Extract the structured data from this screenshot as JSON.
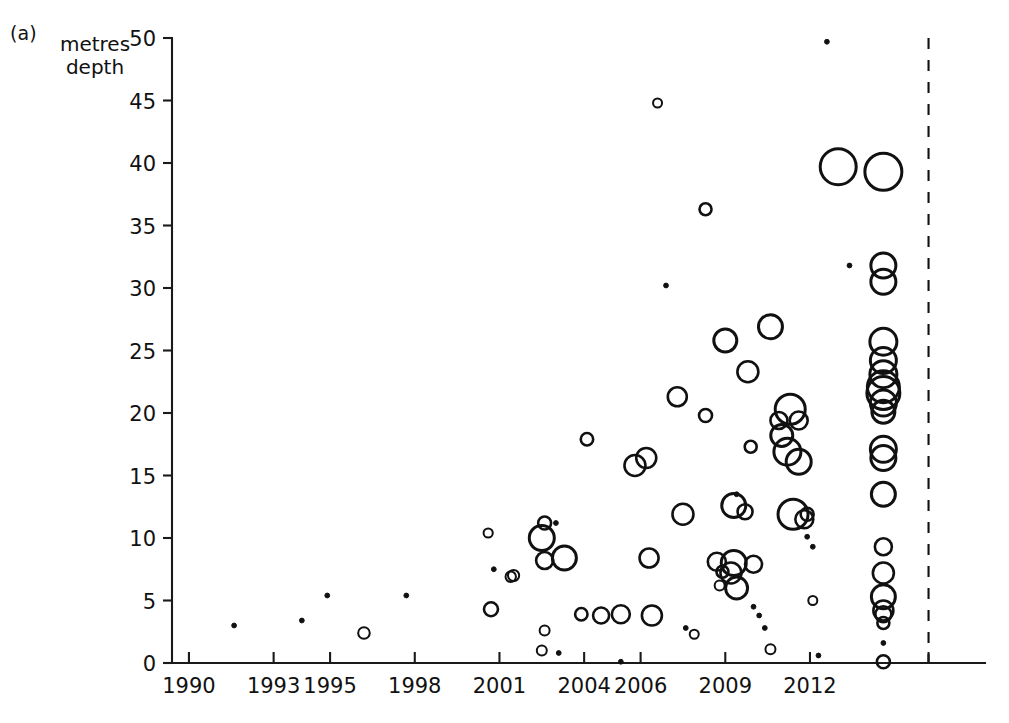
{
  "figure": {
    "panel_label": "(a)",
    "y_axis_title": "metres\ndepth"
  },
  "chart_data": {
    "type": "scatter",
    "title": "",
    "xlabel": "",
    "ylabel": "metres depth",
    "xtick_labels": [
      "1990",
      "1993",
      "1995",
      "1998",
      "2001",
      "2004",
      "2006",
      "2009",
      "2012"
    ],
    "xtick_values": [
      1990,
      1993,
      1995,
      1998,
      2001,
      2004,
      2006,
      2009,
      2012
    ],
    "ytick_labels": [
      "0",
      "5",
      "10",
      "15",
      "20",
      "25",
      "30",
      "35",
      "40",
      "45",
      "50"
    ],
    "ytick_values": [
      0,
      5,
      10,
      15,
      20,
      25,
      30,
      35,
      40,
      45,
      50
    ],
    "xlim": [
      1989.4,
      2018.2
    ],
    "ylim": [
      0,
      50
    ],
    "grid": false,
    "legend": null,
    "marker_style": "open-circle, area proportional to magnitude",
    "annotations": [
      {
        "name": "reference-divider",
        "type": "vertical-dashed-line",
        "x": 2016.2
      }
    ],
    "series": [
      {
        "name": "records",
        "color": "#111111",
        "points": [
          {
            "x": 1991.6,
            "y": 3.0,
            "r": 4.0
          },
          {
            "x": 1994.0,
            "y": 3.4,
            "r": 3.6
          },
          {
            "x": 1994.9,
            "y": 5.4,
            "r": 4.2
          },
          {
            "x": 1996.2,
            "y": 2.4,
            "r": 5.8
          },
          {
            "x": 1997.7,
            "y": 5.4,
            "r": 4.0
          },
          {
            "x": 2000.6,
            "y": 10.4,
            "r": 4.6
          },
          {
            "x": 2000.8,
            "y": 7.5,
            "r": 4.2
          },
          {
            "x": 2000.7,
            "y": 4.3,
            "r": 7.0
          },
          {
            "x": 2001.5,
            "y": 7.0,
            "r": 5.6
          },
          {
            "x": 2001.4,
            "y": 6.9,
            "r": 5.2
          },
          {
            "x": 2002.5,
            "y": 10.0,
            "r": 12.5
          },
          {
            "x": 2002.6,
            "y": 11.2,
            "r": 6.5
          },
          {
            "x": 2003.0,
            "y": 11.2,
            "r": 3.6
          },
          {
            "x": 2002.6,
            "y": 8.2,
            "r": 8.5
          },
          {
            "x": 2003.3,
            "y": 8.4,
            "r": 12.0
          },
          {
            "x": 2002.5,
            "y": 1.0,
            "r": 5.0
          },
          {
            "x": 2002.6,
            "y": 2.6,
            "r": 5.0
          },
          {
            "x": 2003.1,
            "y": 0.8,
            "r": 3.8
          },
          {
            "x": 2004.1,
            "y": 17.9,
            "r": 6.2
          },
          {
            "x": 2003.9,
            "y": 3.9,
            "r": 6.2
          },
          {
            "x": 2004.6,
            "y": 3.8,
            "r": 8.0
          },
          {
            "x": 2005.3,
            "y": 3.9,
            "r": 9.0
          },
          {
            "x": 2005.3,
            "y": 0.1,
            "r": 4.2
          },
          {
            "x": 2005.8,
            "y": 15.8,
            "r": 10.5
          },
          {
            "x": 2006.2,
            "y": 16.4,
            "r": 10.0
          },
          {
            "x": 2006.3,
            "y": 8.4,
            "r": 9.5
          },
          {
            "x": 2006.4,
            "y": 3.8,
            "r": 10.0
          },
          {
            "x": 2006.6,
            "y": 44.8,
            "r": 4.5
          },
          {
            "x": 2006.9,
            "y": 30.2,
            "r": 3.4
          },
          {
            "x": 2007.3,
            "y": 21.3,
            "r": 9.5
          },
          {
            "x": 2007.5,
            "y": 11.9,
            "r": 10.5
          },
          {
            "x": 2007.6,
            "y": 2.8,
            "r": 3.4
          },
          {
            "x": 2007.9,
            "y": 2.3,
            "r": 4.5
          },
          {
            "x": 2008.3,
            "y": 19.8,
            "r": 6.5
          },
          {
            "x": 2008.3,
            "y": 36.3,
            "r": 6.0
          },
          {
            "x": 2008.7,
            "y": 8.1,
            "r": 9.0
          },
          {
            "x": 2008.9,
            "y": 7.3,
            "r": 6.0
          },
          {
            "x": 2008.8,
            "y": 6.2,
            "r": 5.0
          },
          {
            "x": 2009.0,
            "y": 25.8,
            "r": 11.5
          },
          {
            "x": 2009.3,
            "y": 8.0,
            "r": 12.5
          },
          {
            "x": 2009.2,
            "y": 7.2,
            "r": 10.5
          },
          {
            "x": 2009.4,
            "y": 6.0,
            "r": 11.0
          },
          {
            "x": 2009.4,
            "y": 13.5,
            "r": 4.2
          },
          {
            "x": 2009.3,
            "y": 12.6,
            "r": 12.0
          },
          {
            "x": 2009.7,
            "y": 12.1,
            "r": 7.5
          },
          {
            "x": 2009.8,
            "y": 23.3,
            "r": 10.5
          },
          {
            "x": 2009.9,
            "y": 17.3,
            "r": 6.0
          },
          {
            "x": 2010.0,
            "y": 7.9,
            "r": 8.5
          },
          {
            "x": 2010.0,
            "y": 4.5,
            "r": 3.2
          },
          {
            "x": 2010.2,
            "y": 3.8,
            "r": 3.2
          },
          {
            "x": 2010.4,
            "y": 2.8,
            "r": 3.2
          },
          {
            "x": 2010.6,
            "y": 1.1,
            "r": 5.0
          },
          {
            "x": 2010.6,
            "y": 26.9,
            "r": 12.0
          },
          {
            "x": 2010.9,
            "y": 19.4,
            "r": 8.5
          },
          {
            "x": 2011.0,
            "y": 18.2,
            "r": 11.0
          },
          {
            "x": 2011.2,
            "y": 16.9,
            "r": 13.5
          },
          {
            "x": 2011.3,
            "y": 20.3,
            "r": 15.0
          },
          {
            "x": 2011.6,
            "y": 19.4,
            "r": 9.0
          },
          {
            "x": 2011.6,
            "y": 16.1,
            "r": 12.5
          },
          {
            "x": 2011.4,
            "y": 11.9,
            "r": 15.0
          },
          {
            "x": 2011.8,
            "y": 11.5,
            "r": 9.0
          },
          {
            "x": 2011.9,
            "y": 11.9,
            "r": 6.5
          },
          {
            "x": 2011.9,
            "y": 10.1,
            "r": 3.2
          },
          {
            "x": 2012.1,
            "y": 9.3,
            "r": 3.2
          },
          {
            "x": 2012.1,
            "y": 5.0,
            "r": 4.5
          },
          {
            "x": 2012.3,
            "y": 0.6,
            "r": 4.2
          },
          {
            "x": 2012.6,
            "y": 49.7,
            "r": 4.0
          },
          {
            "x": 2013.0,
            "y": 39.7,
            "r": 18.0
          },
          {
            "x": 2013.4,
            "y": 31.8,
            "r": 3.8
          },
          {
            "x": 2014.6,
            "y": 39.3,
            "r": 18.5
          },
          {
            "x": 2014.6,
            "y": 31.8,
            "r": 12.5
          },
          {
            "x": 2014.6,
            "y": 30.5,
            "r": 12.5
          },
          {
            "x": 2014.6,
            "y": 25.7,
            "r": 13.5
          },
          {
            "x": 2014.6,
            "y": 24.2,
            "r": 13.0
          },
          {
            "x": 2014.6,
            "y": 23.1,
            "r": 13.5
          },
          {
            "x": 2014.6,
            "y": 22.1,
            "r": 16.0
          },
          {
            "x": 2014.6,
            "y": 21.6,
            "r": 16.5
          },
          {
            "x": 2014.6,
            "y": 20.8,
            "r": 13.0
          },
          {
            "x": 2014.6,
            "y": 20.1,
            "r": 11.5
          },
          {
            "x": 2014.6,
            "y": 17.1,
            "r": 13.0
          },
          {
            "x": 2014.6,
            "y": 16.4,
            "r": 12.5
          },
          {
            "x": 2014.6,
            "y": 13.5,
            "r": 12.0
          },
          {
            "x": 2014.6,
            "y": 9.3,
            "r": 8.5
          },
          {
            "x": 2014.6,
            "y": 7.2,
            "r": 10.5
          },
          {
            "x": 2014.6,
            "y": 5.3,
            "r": 12.0
          },
          {
            "x": 2014.6,
            "y": 4.2,
            "r": 10.0
          },
          {
            "x": 2014.6,
            "y": 3.9,
            "r": 8.0
          },
          {
            "x": 2014.6,
            "y": 3.2,
            "r": 6.0
          },
          {
            "x": 2014.6,
            "y": 1.6,
            "r": 4.0
          },
          {
            "x": 2014.6,
            "y": 0.1,
            "r": 6.5
          }
        ]
      }
    ]
  }
}
